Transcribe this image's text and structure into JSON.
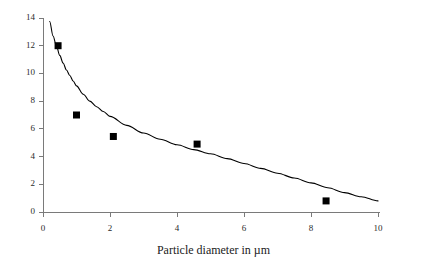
{
  "chart_data": {
    "type": "scatter",
    "title": "",
    "xlabel": "Particle diameter in µm",
    "ylabel": "",
    "xlim": [
      0,
      10
    ],
    "ylim": [
      0,
      14
    ],
    "xticks": [
      0,
      2,
      4,
      6,
      8,
      10
    ],
    "yticks": [
      0,
      2,
      4,
      6,
      8,
      10,
      12,
      14
    ],
    "xtick_labels": [
      "0",
      "2",
      "4",
      "6",
      "8",
      "10"
    ],
    "ytick_labels": [
      "0",
      "2",
      "4",
      "6",
      "8",
      "10",
      "12",
      "14"
    ],
    "grid": false,
    "legend": null,
    "marker_style": "filled-square",
    "marker_color": "#000000",
    "line_color": "#000000",
    "axis_color": "#7a7a7a",
    "series": [
      {
        "name": "measurements",
        "type": "scatter",
        "points": [
          {
            "x": 0.45,
            "y": 12.0
          },
          {
            "x": 1.0,
            "y": 7.0
          },
          {
            "x": 2.1,
            "y": 5.45
          },
          {
            "x": 4.6,
            "y": 4.9
          },
          {
            "x": 8.45,
            "y": 0.8
          }
        ]
      },
      {
        "name": "fitted-curve",
        "type": "line",
        "points": [
          {
            "x": 0.2,
            "y": 13.75
          },
          {
            "x": 0.3,
            "y": 12.7
          },
          {
            "x": 0.4,
            "y": 12.0
          },
          {
            "x": 0.5,
            "y": 11.3
          },
          {
            "x": 0.6,
            "y": 10.75
          },
          {
            "x": 0.7,
            "y": 10.25
          },
          {
            "x": 0.8,
            "y": 9.85
          },
          {
            "x": 0.9,
            "y": 9.45
          },
          {
            "x": 1.0,
            "y": 9.1
          },
          {
            "x": 1.2,
            "y": 8.5
          },
          {
            "x": 1.4,
            "y": 8.0
          },
          {
            "x": 1.6,
            "y": 7.6
          },
          {
            "x": 1.8,
            "y": 7.25
          },
          {
            "x": 2.0,
            "y": 6.9
          },
          {
            "x": 2.5,
            "y": 6.25
          },
          {
            "x": 3.0,
            "y": 5.7
          },
          {
            "x": 3.5,
            "y": 5.25
          },
          {
            "x": 4.0,
            "y": 4.85
          },
          {
            "x": 4.5,
            "y": 4.5
          },
          {
            "x": 5.0,
            "y": 4.2
          },
          {
            "x": 5.5,
            "y": 3.85
          },
          {
            "x": 6.0,
            "y": 3.5
          },
          {
            "x": 6.5,
            "y": 3.15
          },
          {
            "x": 7.0,
            "y": 2.8
          },
          {
            "x": 7.5,
            "y": 2.45
          },
          {
            "x": 8.0,
            "y": 2.1
          },
          {
            "x": 8.5,
            "y": 1.75
          },
          {
            "x": 9.0,
            "y": 1.4
          },
          {
            "x": 9.5,
            "y": 1.1
          },
          {
            "x": 10.0,
            "y": 0.8
          }
        ]
      }
    ]
  },
  "colors": {
    "background": "#ffffff",
    "ink": "#1a1a1a",
    "axis": "#7a7a7a",
    "data": "#000000"
  }
}
